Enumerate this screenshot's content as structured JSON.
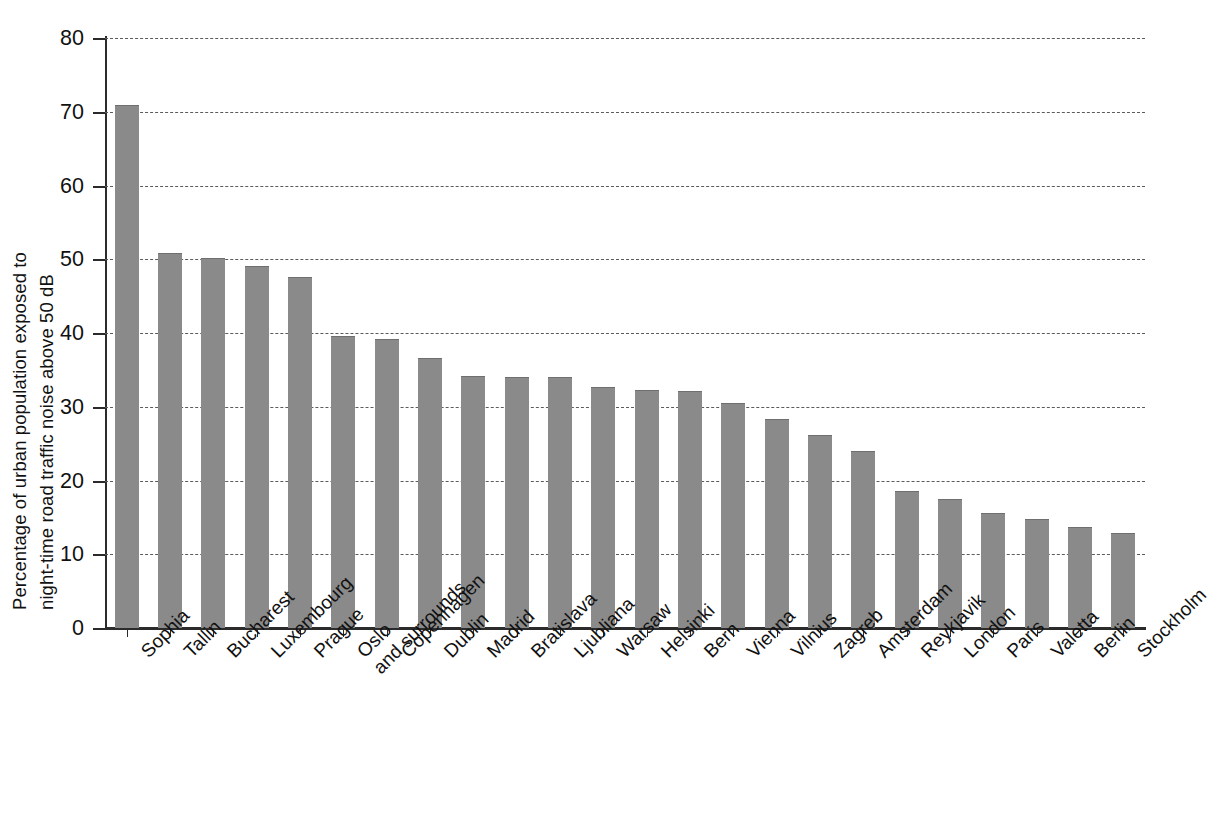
{
  "chart_data": {
    "type": "bar",
    "title": "",
    "subtitle": "",
    "xlabel": "",
    "ylabel": "Percentage of urban population exposed to night-time road traffic noise above 50 dB",
    "ylabel_lines": [
      "Percentage of urban population exposed to",
      "night-time road traffic noise above 50 dB"
    ],
    "ylim": [
      0,
      80
    ],
    "ytick_values": [
      0,
      10,
      20,
      30,
      40,
      50,
      60,
      70,
      80
    ],
    "ytick_labels": [
      "0",
      "10",
      "20",
      "30",
      "40",
      "50",
      "60",
      "70",
      "80"
    ],
    "grid": "horizontal-dashed",
    "legend": "none",
    "bar_color": "#8a8a8a",
    "axis_color": "#2b2b2b",
    "gridline_color": "#5b5b5b",
    "categories": [
      "Sophia",
      "Tallin",
      "Bucharest",
      "Luxembourg",
      "Prague",
      "Oslo and surrounds",
      "Copenhagen",
      "Dublin",
      "Madrid",
      "Bratislava",
      "Ljubliana",
      "Warsaw",
      "Helsinki",
      "Bern",
      "Vienna",
      "Vilnius",
      "Zagreb",
      "Amsterdam",
      "Reykjavik",
      "London",
      "Paris",
      "Valetta",
      "Berlin",
      "Stockholm"
    ],
    "values": [
      70.8,
      50.7,
      50.0,
      48.9,
      47.5,
      39.5,
      39.0,
      36.5,
      34.1,
      33.9,
      33.9,
      32.5,
      32.1,
      32.0,
      30.4,
      28.2,
      26.0,
      23.8,
      18.4,
      17.3,
      15.4,
      14.6,
      13.5,
      12.7
    ],
    "units": "percent"
  }
}
